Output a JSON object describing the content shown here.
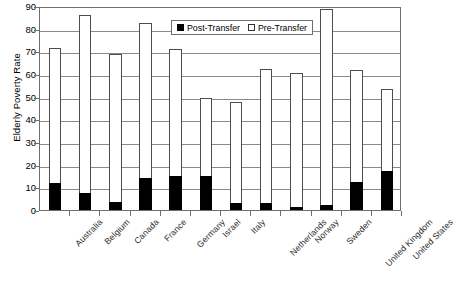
{
  "chart_data": {
    "type": "bar",
    "title": "",
    "xlabel": "",
    "ylabel": "Elderly Poverty Rate",
    "ylim": [
      0,
      90
    ],
    "ytick_step": 10,
    "yticks": [
      0,
      10,
      20,
      30,
      40,
      50,
      60,
      70,
      80,
      90
    ],
    "grid": true,
    "legend_position": "top-center",
    "categories": [
      "Australia",
      "Belgium",
      "Canada",
      "France",
      "Germany",
      "Israel",
      "Italy",
      "Netherlands",
      "Norway",
      "Sweden",
      "United Kingdom",
      "United States"
    ],
    "series": [
      {
        "name": "Post-Transfer",
        "color": "#000000",
        "values": [
          11.7,
          7.5,
          3.5,
          14.0,
          14.8,
          15.0,
          3.0,
          3.2,
          1.2,
          2.0,
          12.3,
          17.2
        ]
      },
      {
        "name": "Pre-Transfer",
        "color": "#ffffff",
        "values": [
          71.3,
          86.0,
          69.0,
          82.3,
          71.2,
          49.5,
          47.7,
          62.0,
          60.5,
          88.5,
          61.7,
          53.3
        ]
      }
    ]
  },
  "legend": {
    "items": [
      {
        "label": "Post-Transfer",
        "swatch": "filled-square-icon"
      },
      {
        "label": "Pre-Transfer",
        "swatch": "hollow-square-icon"
      }
    ]
  },
  "axes": {
    "y_title": "Elderly Poverty Rate"
  }
}
